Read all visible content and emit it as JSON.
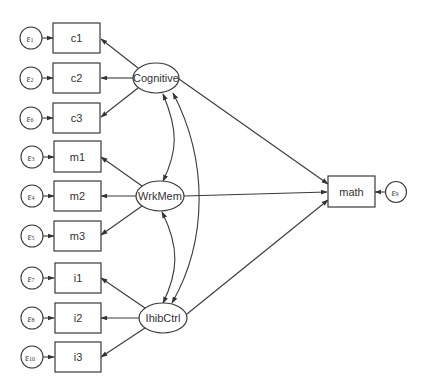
{
  "diagram": {
    "type": "structural-equation-model",
    "latent_variables": [
      {
        "id": "cognitive",
        "label": "Cognitive",
        "indicators": [
          "c1",
          "c2",
          "c3"
        ]
      },
      {
        "id": "wrkmem",
        "label": "WrkMem",
        "indicators": [
          "m1",
          "m2",
          "m3"
        ]
      },
      {
        "id": "ihibctrl",
        "label": "IhibCtrl",
        "indicators": [
          "i1",
          "i2",
          "i3"
        ]
      }
    ],
    "observed_variables": [
      {
        "id": "c1",
        "label": "c1",
        "error": {
          "symbol": "ε",
          "sub": "1"
        }
      },
      {
        "id": "c2",
        "label": "c2",
        "error": {
          "symbol": "ε",
          "sub": "2"
        }
      },
      {
        "id": "c3",
        "label": "c3",
        "error": {
          "symbol": "ε",
          "sub": "6"
        }
      },
      {
        "id": "m1",
        "label": "m1",
        "error": {
          "symbol": "ε",
          "sub": "3"
        }
      },
      {
        "id": "m2",
        "label": "m2",
        "error": {
          "symbol": "ε",
          "sub": "4"
        }
      },
      {
        "id": "m3",
        "label": "m3",
        "error": {
          "symbol": "ε",
          "sub": "5"
        }
      },
      {
        "id": "i1",
        "label": "i1",
        "error": {
          "symbol": "ε",
          "sub": "7"
        }
      },
      {
        "id": "i2",
        "label": "i2",
        "error": {
          "symbol": "ε",
          "sub": "8"
        }
      },
      {
        "id": "i3",
        "label": "i3",
        "error": {
          "symbol": "ε",
          "sub": "10"
        }
      }
    ],
    "outcome": {
      "id": "math",
      "label": "math",
      "error": {
        "symbol": "ε",
        "sub": "9"
      }
    },
    "structural_paths": [
      {
        "from": "Cognitive",
        "to": "math"
      },
      {
        "from": "WrkMem",
        "to": "math"
      },
      {
        "from": "IhibCtrl",
        "to": "math"
      }
    ],
    "covariances": [
      {
        "between": [
          "Cognitive",
          "WrkMem"
        ]
      },
      {
        "between": [
          "WrkMem",
          "IhibCtrl"
        ]
      },
      {
        "between": [
          "Cognitive",
          "IhibCtrl"
        ]
      }
    ]
  }
}
